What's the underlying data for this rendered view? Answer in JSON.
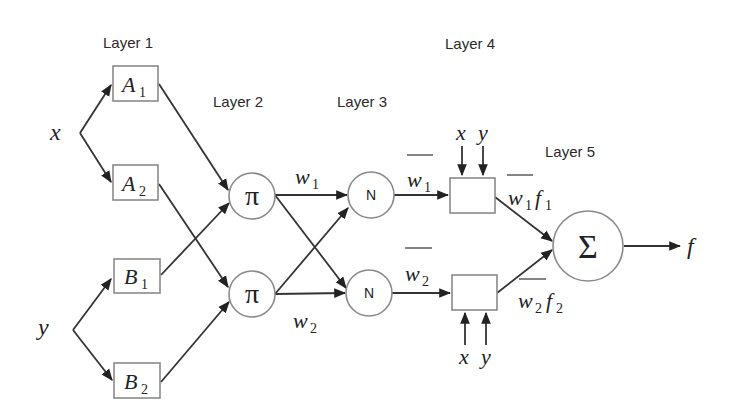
{
  "diagram": {
    "type": "ANFIS architecture",
    "layers": [
      {
        "id": "layer1",
        "label": "Layer 1"
      },
      {
        "id": "layer2",
        "label": "Layer 2"
      },
      {
        "id": "layer3",
        "label": "Layer 3"
      },
      {
        "id": "layer4",
        "label": "Layer 4"
      },
      {
        "id": "layer5",
        "label": "Layer 5"
      }
    ],
    "inputs": {
      "x": "x",
      "y": "y"
    },
    "layer1_nodes": [
      {
        "id": "A1",
        "main": "A",
        "sub": "1"
      },
      {
        "id": "A2",
        "main": "A",
        "sub": "2"
      },
      {
        "id": "B1",
        "main": "B",
        "sub": "1"
      },
      {
        "id": "B2",
        "main": "B",
        "sub": "2"
      }
    ],
    "layer2_nodes": [
      {
        "id": "pi1",
        "symbol": "π"
      },
      {
        "id": "pi2",
        "symbol": "π"
      }
    ],
    "layer2_outputs": [
      {
        "main": "w",
        "sub": "1"
      },
      {
        "main": "w",
        "sub": "2"
      }
    ],
    "layer3_nodes": [
      {
        "id": "N1",
        "symbol": "N"
      },
      {
        "id": "N2",
        "symbol": "N"
      }
    ],
    "layer3_outputs": [
      {
        "main": "w",
        "sub": "1",
        "overline": true
      },
      {
        "main": "w",
        "sub": "2",
        "overline": true
      }
    ],
    "layer4_inputs": {
      "x": "x",
      "y": "y"
    },
    "layer4_outputs": [
      {
        "w": "w",
        "w_sub": "1",
        "f": "f",
        "f_sub": "1",
        "overline": true
      },
      {
        "w": "w",
        "w_sub": "2",
        "f": "f",
        "f_sub": "2",
        "overline": true
      }
    ],
    "layer5_node": {
      "id": "sum",
      "symbol": "Σ"
    },
    "output": "f",
    "edges": [
      [
        "x",
        "A1"
      ],
      [
        "x",
        "A2"
      ],
      [
        "y",
        "B1"
      ],
      [
        "y",
        "B2"
      ],
      [
        "A1",
        "pi1"
      ],
      [
        "A2",
        "pi2"
      ],
      [
        "B1",
        "pi1"
      ],
      [
        "B2",
        "pi2"
      ],
      [
        "pi1",
        "N1"
      ],
      [
        "pi1",
        "N2"
      ],
      [
        "pi2",
        "N1"
      ],
      [
        "pi2",
        "N2"
      ],
      [
        "N1",
        "L4a"
      ],
      [
        "N2",
        "L4b"
      ],
      [
        "L4a",
        "sum"
      ],
      [
        "L4b",
        "sum"
      ],
      [
        "sum",
        "f"
      ]
    ]
  }
}
